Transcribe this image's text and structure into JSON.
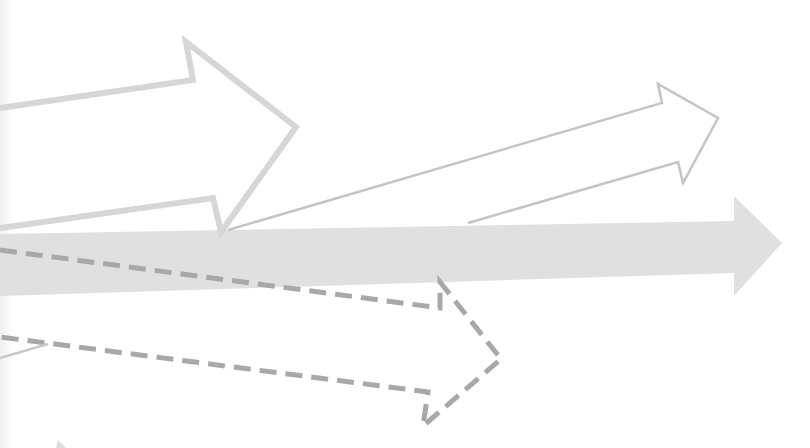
{
  "illustration": {
    "title": "Arrows diverging from a common origin",
    "background": "#ffffff",
    "arrows": [
      {
        "name": "thick-outline-arrow-upper",
        "style": "outline",
        "stroke": "#d6d6d6",
        "stroke_width": 6,
        "points": "0,108 193,80 186,42 296,127 221,232 213,198 0,228"
      },
      {
        "name": "thin-outline-arrow",
        "style": "outline",
        "stroke": "#c4c4c4",
        "stroke_width": 2.5,
        "points": "228,230 662,103 658,84 718,118 683,183 678,162 468,223"
      },
      {
        "name": "solid-arrow",
        "style": "filled",
        "fill": "#e0e0e0",
        "points": "0,234 734,221 734,196 782,243 734,296 734,273 0,296"
      },
      {
        "name": "dashed-arrow-upper",
        "style": "dashed",
        "stroke": "#a8a8a8",
        "stroke_width": 5,
        "points": "0,250 440,308 440,282 501,359 423,426 428,392 0,337"
      },
      {
        "name": "thin-line-lower-left",
        "style": "line",
        "stroke": "#c8c8c8",
        "stroke_width": 2.5,
        "points": "0,358 48,344"
      }
    ]
  }
}
